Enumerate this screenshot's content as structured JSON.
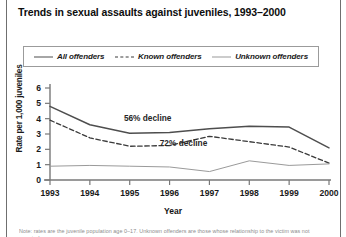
{
  "page": {
    "title": "Trends in sexual assaults against juveniles, 1993–2000",
    "footnote": "Note: rates are the juvenile population age 0–17. Unknown offenders are those whose relationship to the victim was not reported."
  },
  "legend": {
    "items": [
      {
        "label": "All offenders",
        "style": "solid-thick",
        "color": "#4e4e4e"
      },
      {
        "label": "Known offenders",
        "style": "dashed",
        "color": "#3a3a3a"
      },
      {
        "label": "Unknown offenders",
        "style": "solid-thin",
        "color": "#9a9a9a"
      }
    ]
  },
  "annotations": [
    {
      "text": "56% decline",
      "x": 1995.45,
      "y": 3.85
    },
    {
      "text": "72% decline",
      "x": 1996.35,
      "y": 2.25
    }
  ],
  "chart_data": {
    "type": "line",
    "title": "Trends in sexual assaults against juveniles, 1993–2000",
    "xlabel": "Year",
    "ylabel": "Rate per 1,000 juveniles",
    "x": [
      1993,
      1994,
      1995,
      1996,
      1997,
      1998,
      1999,
      2000
    ],
    "categories": [
      "1993",
      "1994",
      "1995",
      "1996",
      "1997",
      "1998",
      "1999",
      "2000"
    ],
    "xlim": [
      1993,
      2000
    ],
    "ylim": [
      0,
      6
    ],
    "yticks": [
      0,
      1,
      2,
      3,
      4,
      5,
      6
    ],
    "ytick_labels": [
      "0",
      "1",
      "2",
      "3",
      "4",
      "5",
      "6"
    ],
    "grid": false,
    "legend_position": "top",
    "series": [
      {
        "name": "All offenders",
        "color": "#4e4e4e",
        "style": "solid",
        "width": 1.5,
        "values": [
          4.8,
          3.6,
          3.05,
          3.1,
          3.35,
          3.5,
          3.45,
          2.1
        ]
      },
      {
        "name": "Known offenders",
        "color": "#3a3a3a",
        "style": "dashed",
        "width": 1.3,
        "values": [
          3.9,
          2.75,
          2.2,
          2.25,
          2.85,
          2.5,
          2.15,
          1.1
        ]
      },
      {
        "name": "Unknown offenders",
        "color": "#9a9a9a",
        "style": "solid",
        "width": 1.0,
        "values": [
          0.9,
          0.95,
          0.9,
          0.85,
          0.55,
          1.25,
          0.95,
          1.05
        ]
      }
    ]
  }
}
